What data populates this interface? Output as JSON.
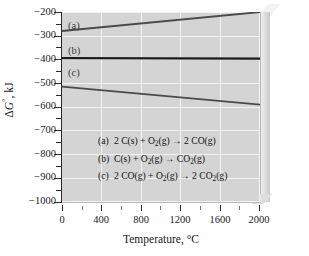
{
  "chart_data": {
    "type": "line",
    "title": "",
    "xlabel": "Temperature, °C",
    "ylabel": "ΔG°, kJ",
    "xlim": [
      0,
      2000
    ],
    "ylim": [
      -1000,
      -200
    ],
    "grid": true,
    "legend_position": "inside-center",
    "x_ticks": [
      0,
      400,
      800,
      1200,
      1600,
      2000
    ],
    "x_tick_labels": [
      "0",
      "400",
      "800",
      "1200",
      "1600",
      "2000"
    ],
    "x_minor_ticks": [
      200,
      600,
      1000,
      1400,
      1800
    ],
    "y_ticks": [
      -200,
      -300,
      -400,
      -500,
      -600,
      -700,
      -800,
      -900,
      -1000
    ],
    "y_tick_labels": [
      "−200",
      "−300",
      "−400",
      "−500",
      "−600",
      "−700",
      "−800",
      "−900",
      "−1000"
    ],
    "y_minor_ticks": [
      -250,
      -350,
      -450,
      -550,
      -650,
      -750,
      -850,
      -950
    ],
    "series": [
      {
        "name": "a",
        "label": "2 C(s) + O2(g) → 2 CO(g)",
        "color": "#4a4a4a",
        "x": [
          0,
          2000
        ],
        "values": [
          -280,
          -200
        ]
      },
      {
        "name": "b",
        "label": "C(s) + O2(g) → CO2(g)",
        "color": "#1a1a1a",
        "x": [
          0,
          2000
        ],
        "values": [
          -394,
          -396
        ]
      },
      {
        "name": "c",
        "label": "2 CO(g) + O2(g) → 2 CO2(g)",
        "color": "#4a4a4a",
        "x": [
          0,
          2000
        ],
        "values": [
          -514,
          -590
        ]
      }
    ],
    "intersection_point": {
      "x": 710,
      "y": -394
    },
    "annotations": [
      {
        "text": "(a)",
        "x": 120,
        "y": -258
      },
      {
        "text": "(b)",
        "x": 120,
        "y": -368
      },
      {
        "text": "(c)",
        "x": 120,
        "y": -455
      }
    ]
  },
  "axes": {
    "y_title_delta": "Δ",
    "y_title_g": "G",
    "y_title_deg": "°",
    "y_title_unit": ", kJ",
    "x_title": "Temperature, °C"
  },
  "ytick_labels": {
    "t200": "−200",
    "t300": "−300",
    "t400": "−400",
    "t500": "−500",
    "t600": "−600",
    "t700": "−700",
    "t800": "−800",
    "t900": "−900",
    "t1000": "−1000"
  },
  "xtick_labels": {
    "x0": "0",
    "x400": "400",
    "x800": "800",
    "x1200": "1200",
    "x1600": "1600",
    "x2000": "2000"
  },
  "curve_tags": {
    "a": "(a)",
    "b": "(b)",
    "c": "(c)"
  },
  "legend": {
    "rows": [
      {
        "tag": "(a)",
        "pre": "2 C(s) + O",
        "sub1": "2",
        "mid": "(g)",
        "arrow": "→",
        "post": "2 CO(g)",
        "sub2": ""
      },
      {
        "tag": "(b)",
        "pre": "C(s) + O",
        "sub1": "2",
        "mid": "(g)",
        "arrow": "→",
        "post": "CO",
        "sub2": "2",
        "tail": "(g)"
      },
      {
        "tag": "(c)",
        "pre": "2 CO(g) + O",
        "sub1": "2",
        "mid": "(g)",
        "arrow": "→",
        "post": "2 CO",
        "sub2": "2",
        "tail": "(g)"
      }
    ]
  },
  "colors": {
    "plot_background": "#d4d4d4",
    "gridlines": "#f4f4f4",
    "line_a": "#4a4a4a",
    "line_b": "#1a1a1a",
    "line_c": "#4a4a4a",
    "axis": "#2a2a2a",
    "page_background": "#ffffff"
  }
}
